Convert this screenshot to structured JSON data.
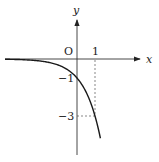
{
  "chart_data": {
    "type": "line",
    "title": "",
    "function": "y = -3^x",
    "xlabel": "x",
    "ylabel": "y",
    "origin_label": "O",
    "x_ticks": [
      {
        "value": 1,
        "label": "1"
      }
    ],
    "y_ticks": [
      {
        "value": -1,
        "label": "−1"
      },
      {
        "value": -3,
        "label": "−3"
      }
    ],
    "series": [
      {
        "name": "curve",
        "x": [
          -4.2,
          -3,
          -2,
          -1,
          -0.5,
          0,
          0.5,
          1,
          1.3
        ],
        "values": [
          -0.01,
          -0.04,
          -0.11,
          -0.33,
          -0.58,
          -1,
          -1.73,
          -3,
          -4.17
        ]
      }
    ],
    "guides": [
      {
        "type": "dashed-vertical",
        "x": 1,
        "from_y": 0,
        "to_y": -3
      },
      {
        "type": "dashed-horizontal",
        "y": -3,
        "from_x": 0,
        "to_x": 1
      }
    ],
    "xlim": [
      -4.3,
      3.6
    ],
    "ylim": [
      -5,
      3.1
    ],
    "grid": false,
    "colors": {
      "axis": "#333333",
      "curve": "#1a1a1a",
      "guide": "#555555"
    }
  }
}
